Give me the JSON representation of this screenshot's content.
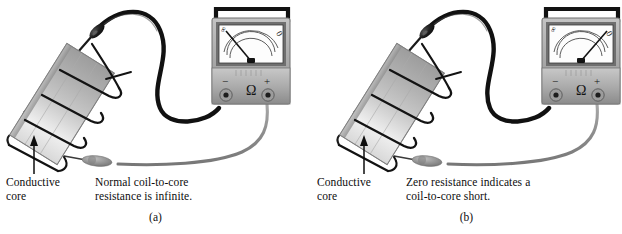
{
  "figure": {
    "type": "two-panel-instrument-diagram",
    "background": "#ffffff",
    "width": 622,
    "height": 234
  },
  "colors": {
    "cable_black": "#111111",
    "cable_gray": "#8e8e8e",
    "meter_body": "#b4b4b4",
    "meter_body_dark": "#8a8a8a",
    "meter_face": "#fdfdfd",
    "meter_bezel": "#6f6f6f",
    "handle": "#121212",
    "core_light": "#e3e3e3",
    "core_mid": "#c0c0c0",
    "core_dark": "#9a9a9a",
    "text": "#0d0d0d",
    "probe_gray": "#9b9b9b",
    "probe_black": "#161616"
  },
  "panels": [
    {
      "id": "a",
      "letter": "(a)",
      "core_label": {
        "line1": "Conductive",
        "line2": "core"
      },
      "note": {
        "line1": "Normal coil-to-core",
        "line2": "resistance is infinite."
      },
      "meter": {
        "scale_left_label": "∞",
        "scale_right_label": "0",
        "terminal_negative": "−",
        "terminal_unit": "Ω",
        "terminal_positive": "+",
        "needle_reading": "infinite",
        "needle_angle_deg": -52,
        "arc_count": 3
      },
      "core": {
        "coil_turns": 4,
        "tilt_deg": -58
      },
      "probes": {
        "black_probe": "coil-lead-probe",
        "gray_probe": "core-contact-probe"
      }
    },
    {
      "id": "b",
      "letter": "(b)",
      "core_label": {
        "line1": "Conductive",
        "line2": "core"
      },
      "note": {
        "line1": "Zero resistance indicates a",
        "line2": "coil-to-core short."
      },
      "meter": {
        "scale_left_label": "∞",
        "scale_right_label": "0",
        "terminal_negative": "−",
        "terminal_unit": "Ω",
        "terminal_positive": "+",
        "needle_reading": "zero",
        "needle_angle_deg": 50,
        "arc_count": 3
      },
      "core": {
        "coil_turns": 4,
        "tilt_deg": -58
      },
      "probes": {
        "black_probe": "coil-lead-probe",
        "gray_probe": "core-contact-probe"
      }
    }
  ]
}
